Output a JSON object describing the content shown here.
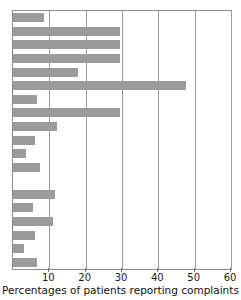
{
  "chart_data": {
    "type": "bar",
    "orientation": "horizontal",
    "title": "",
    "xlabel": "Percentages of patients reporting complaints",
    "ylabel": "",
    "xlim": [
      0,
      60
    ],
    "ylim": null,
    "grid": true,
    "legend": false,
    "bar_color": "#9b9b9b",
    "axis_color": "#8a8a8a",
    "xticks": [
      10,
      20,
      30,
      40,
      50,
      60
    ],
    "xtick_labels": [
      "10",
      "20",
      "30",
      "40",
      "50",
      "60"
    ],
    "categories": [
      "1",
      "2",
      "3",
      "4",
      "5",
      "6",
      "7",
      "8",
      "9",
      "10",
      "11",
      "12",
      "",
      "13",
      "14",
      "15",
      "16",
      "17",
      "18"
    ],
    "values": [
      8.5,
      29.5,
      29.5,
      29.5,
      18.0,
      47.5,
      6.5,
      29.5,
      12.0,
      6.0,
      3.5,
      7.5,
      0,
      11.5,
      5.5,
      11.0,
      6.0,
      3.0,
      6.5
    ]
  }
}
